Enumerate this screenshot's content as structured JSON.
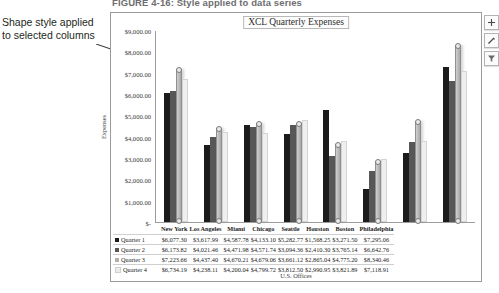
{
  "figure": {
    "number": "FIGURE 4-16:",
    "caption": "Style applied to data series",
    "full": "FIGURE 4-16: Style applied to data series"
  },
  "callout": {
    "text": "Shape style applied to selected columns",
    "line1": "Shape style applied",
    "line2": "to selected columns"
  },
  "chart": {
    "title": "XCL Quarterly Expenses",
    "buttons": [
      {
        "name": "chart-elements-button",
        "icon": "plus-icon",
        "label": "+"
      },
      {
        "name": "chart-styles-button",
        "icon": "paintbrush-icon",
        "label": "Chart Styles"
      },
      {
        "name": "chart-filters-button",
        "icon": "funnel-icon",
        "label": "Chart Filters"
      }
    ]
  },
  "chart_data": {
    "type": "bar",
    "title": "XCL Quarterly Expenses",
    "xlabel": "U.S. Offices",
    "ylabel": "Expenses",
    "ylim": [
      0,
      9000
    ],
    "ytick_labels": [
      "$9,000.00",
      "$8,000.00",
      "$7,000.00",
      "$6,000.00",
      "$5,000.00",
      "$4,000.00",
      "$3,000.00",
      "$2,000.00",
      "$1,000.00",
      "$-"
    ],
    "ytick_values": [
      9000,
      8000,
      7000,
      6000,
      5000,
      4000,
      3000,
      2000,
      1000,
      0
    ],
    "grid": false,
    "legend": "bottom-data-table",
    "selected_series": "Quarter 3",
    "categories": [
      "New York",
      "Los Angeles",
      "Miami",
      "Chicago",
      "Seattle",
      "Houston",
      "Boston",
      "Philadelphia"
    ],
    "series": [
      {
        "name": "Quarter 1",
        "color": "#1b1b1b",
        "values": [
          6077.3,
          3617.99,
          4587.78,
          4133.1,
          5282.77,
          1568.25,
          3271.5,
          7295.06
        ],
        "labels": [
          "$6,077.30",
          "$3,617.99",
          "$4,587.78",
          "$4,133.10",
          "$5,282.77",
          "$1,568.25",
          "$3,271.50",
          "$7,295.06"
        ]
      },
      {
        "name": "Quarter 2",
        "color": "#575757",
        "values": [
          6173.82,
          4021.46,
          4471.98,
          4571.74,
          3094.36,
          2410.3,
          3765.14,
          6642.76
        ],
        "labels": [
          "$6,173.82",
          "$4,021.46",
          "$4,471.98",
          "$4,571.74",
          "$3,094.36",
          "$2,410.30",
          "$3,765.14",
          "$6,642.76"
        ]
      },
      {
        "name": "Quarter 3",
        "color": "#b0b0b0",
        "values": [
          7223.66,
          4437.4,
          4670.21,
          4679.06,
          3661.12,
          2865.04,
          4775.2,
          8340.46
        ],
        "labels": [
          "$7,223.66",
          "$4,437.40",
          "$4,670.21",
          "$4,679.06",
          "$3,661.12",
          "$2,865.04",
          "$4,775.20",
          "$8,340.46"
        ]
      },
      {
        "name": "Quarter 4",
        "color": "#ececec",
        "values": [
          6734.19,
          4238.11,
          4200.04,
          4799.72,
          3812.5,
          2990.95,
          3821.89,
          7118.91
        ],
        "labels": [
          "$6,734.19",
          "$4,238.11",
          "$4,200.04",
          "$4,799.72",
          "$3,812.50",
          "$2,990.95",
          "$3,821.89",
          "$7,118.91"
        ]
      }
    ]
  }
}
